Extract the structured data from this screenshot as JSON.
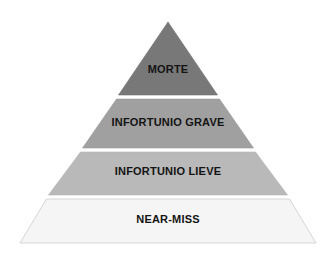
{
  "diagram": {
    "name": "safety-incident-pyramid",
    "type": "pyramid",
    "background_color": "#ffffff",
    "levels": [
      {
        "index": 1,
        "label": "MORTE",
        "fill_color": "#787878",
        "stroke_color": "#6e6e6e",
        "text_color": "#141414",
        "position": "top"
      },
      {
        "index": 2,
        "label": "INFORTUNIO GRAVE",
        "fill_color": "#a0a0a0",
        "stroke_color": "#9a9a9a",
        "text_color": "#141414",
        "position": "upper-middle"
      },
      {
        "index": 3,
        "label": "INFORTUNIO LIEVE",
        "fill_color": "#b9b9b9",
        "stroke_color": "#b2b2b2",
        "text_color": "#141414",
        "position": "lower-middle"
      },
      {
        "index": 4,
        "label": "NEAR-MISS",
        "fill_color": "#f5f5f5",
        "stroke_color": "#d6d6d6",
        "text_color": "#141414",
        "position": "base"
      }
    ],
    "geometry": {
      "apex_x": 168,
      "apex_y": 22,
      "base_left_x": 20,
      "base_right_x": 316,
      "base_y": 243,
      "divider_1_y": 96,
      "divider_2_y": 149,
      "divider_3_y": 196,
      "divider_color": "#ffffff"
    }
  }
}
